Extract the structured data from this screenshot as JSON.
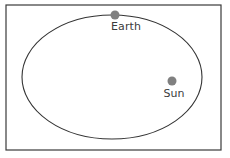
{
  "diagram": {
    "type": "orbital-diagram",
    "frame": {
      "name": "panel-border",
      "stroke_color": "#3a3a3a",
      "fill_color": "#ffffff",
      "x": 6,
      "y": 5,
      "width": 215,
      "height": 145
    },
    "orbit": {
      "name": "elliptical-orbit",
      "shape": "ellipse",
      "stroke_color": "#333333",
      "center_x": 112,
      "center_y": 77,
      "radius_x": 90,
      "radius_y": 62
    },
    "bodies": [
      {
        "id": "earth",
        "label": "Earth",
        "color": "#808080",
        "radius": 4.5,
        "cx": 115,
        "cy": 15,
        "label_x": 126,
        "label_y": 30,
        "label_anchor": "middle"
      },
      {
        "id": "sun",
        "label": "Sun",
        "color": "#808080",
        "radius": 4.5,
        "cx": 172,
        "cy": 81,
        "label_x": 174,
        "label_y": 97,
        "label_anchor": "middle"
      }
    ]
  }
}
